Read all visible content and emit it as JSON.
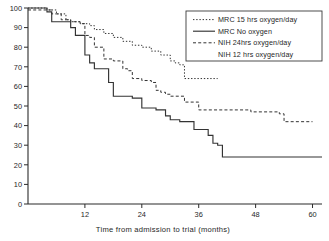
{
  "chart_data": {
    "type": "line",
    "title": "",
    "xlabel": "Time from admission to trial (months)",
    "ylabel": "",
    "xlim": [
      0,
      62
    ],
    "ylim": [
      0,
      100
    ],
    "xticks": [
      12,
      24,
      36,
      48,
      60
    ],
    "yticks": [
      0,
      10,
      20,
      30,
      40,
      50,
      60,
      70,
      80,
      90,
      100
    ],
    "grid": false,
    "legend_position": "top-right",
    "step_plot": true,
    "series": [
      {
        "name": "MRC 15 hrs oxygen/day",
        "style": "dotted",
        "x": [
          0,
          2,
          4,
          6,
          8,
          9,
          11,
          13,
          14,
          16,
          18,
          20,
          22,
          24,
          26,
          28,
          30,
          31,
          32,
          33,
          40
        ],
        "y": [
          100,
          100,
          99,
          97,
          94,
          93,
          92,
          91,
          89,
          87,
          85,
          83,
          81,
          80,
          78,
          76,
          73,
          72,
          71,
          64,
          64
        ]
      },
      {
        "name": "MRC No oxygen",
        "style": "solid",
        "x": [
          0,
          2,
          4,
          5,
          6,
          8,
          9,
          10,
          11,
          12,
          13,
          14,
          16,
          17,
          18,
          20,
          22,
          24,
          25,
          27,
          29,
          30,
          32,
          35,
          36,
          37,
          38,
          39,
          40,
          41,
          62
        ],
        "y": [
          100,
          100,
          98,
          93,
          93,
          93,
          90,
          86,
          86,
          76,
          72,
          69,
          69,
          62,
          55,
          55,
          54,
          49,
          49,
          48,
          45,
          43,
          42,
          38,
          38,
          38,
          35,
          31,
          30,
          24,
          24
        ]
      },
      {
        "name": "NIH 24 hrs oxygen/day",
        "style": "dashed",
        "x": [
          0,
          3,
          5,
          7,
          9,
          11,
          12,
          13,
          14,
          16,
          18,
          20,
          21,
          22,
          24,
          26,
          27,
          28,
          29,
          30,
          31,
          33,
          36,
          46,
          47,
          53,
          54,
          60
        ],
        "y": [
          99,
          99,
          97,
          94,
          93,
          92,
          86,
          85,
          80,
          74,
          73,
          69,
          68,
          64,
          63,
          62,
          58,
          57,
          56,
          55,
          55,
          52,
          48,
          48,
          47,
          46,
          42,
          42
        ]
      },
      {
        "name": "NIH 12 hrs oxygen/day",
        "style": "none",
        "x": [],
        "y": []
      }
    ]
  },
  "legend": {
    "entries": [
      {
        "label": "MRC 15 hrs oxygen/day",
        "sample": "dotted"
      },
      {
        "label": "MRC  No oxygen",
        "sample": "solid"
      },
      {
        "label": "NIH  24hrs oxygen/day",
        "sample": "dashed"
      },
      {
        "label": "NIH 12 hrs oxygen/day",
        "sample": "none"
      }
    ]
  },
  "axes": {
    "x_title": "Time  from  admission to trial (months)",
    "x_tick_labels": [
      "12",
      "24",
      "36",
      "48",
      "60"
    ],
    "y_tick_labels": [
      "0",
      "10",
      "20",
      "30",
      "40",
      "50",
      "60",
      "70",
      "80",
      "90",
      "100"
    ]
  },
  "colors": {
    "ink": "#2b2b2b",
    "background": "#ffffff"
  }
}
